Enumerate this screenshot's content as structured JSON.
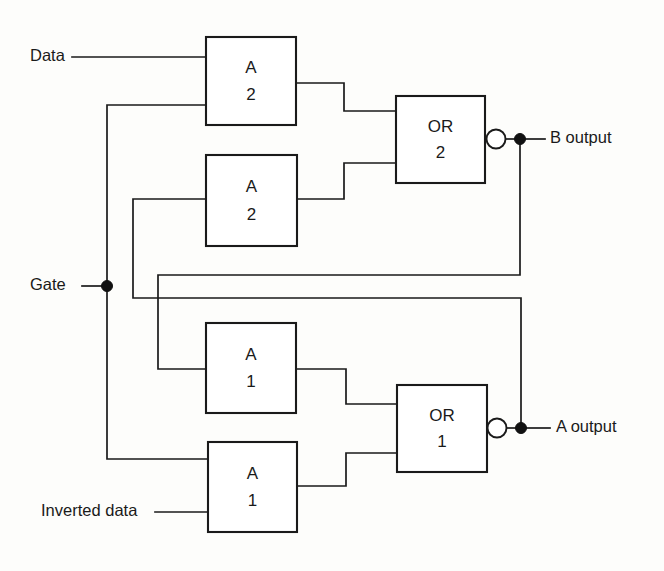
{
  "diagram": {
    "line_color": "#1a1a1a",
    "background_color": "#fdfdfb",
    "inputs": [
      {
        "id": "data",
        "label": "Data",
        "x": 30,
        "y": 57
      },
      {
        "id": "gate",
        "label": "Gate",
        "x": 30,
        "y": 286
      },
      {
        "id": "inverted_data",
        "label": "Inverted data",
        "x": 41,
        "y": 512
      }
    ],
    "outputs": [
      {
        "id": "b_output",
        "label": "B output",
        "x": 550,
        "y": 139
      },
      {
        "id": "a_output",
        "label": "A output",
        "x": 556,
        "y": 428
      }
    ],
    "gates": [
      {
        "id": "and-a2-top",
        "type": "AND",
        "line1": "A",
        "line2": "2",
        "x": 206,
        "y": 37,
        "w": 90,
        "h": 88
      },
      {
        "id": "and-a2-bottom",
        "type": "AND",
        "line1": "A",
        "line2": "2",
        "x": 206,
        "y": 155,
        "w": 91,
        "h": 91
      },
      {
        "id": "or-2",
        "type": "OR",
        "line1": "OR",
        "line2": "2",
        "x": 396,
        "y": 96,
        "w": 89,
        "h": 87
      },
      {
        "id": "and-a1-top",
        "type": "AND",
        "line1": "A",
        "line2": "1",
        "x": 206,
        "y": 323,
        "w": 90,
        "h": 90
      },
      {
        "id": "and-a1-bottom",
        "type": "AND",
        "line1": "A",
        "line2": "1",
        "x": 208,
        "y": 442,
        "w": 89,
        "h": 90
      },
      {
        "id": "or-1",
        "type": "OR",
        "line1": "OR",
        "line2": "1",
        "x": 397,
        "y": 385,
        "w": 90,
        "h": 87
      }
    ],
    "inverter_bubbles": [
      {
        "id": "bubble-or2",
        "cx": 496,
        "cy": 139,
        "r": 9.5
      },
      {
        "id": "bubble-or1",
        "cx": 497,
        "cy": 428,
        "r": 9.5
      }
    ],
    "junctions": [
      {
        "id": "junction-gate",
        "cx": 107,
        "cy": 286,
        "r": 5.5
      },
      {
        "id": "junction-b-output",
        "cx": 520,
        "cy": 139,
        "r": 5.5
      },
      {
        "id": "junction-a-output",
        "cx": 521,
        "cy": 428,
        "r": 5.5
      }
    ],
    "wires": [
      {
        "id": "wire-data-in",
        "d": "M 72 57 L 206 57"
      },
      {
        "id": "wire-gate-in",
        "d": "M 82 286 L 107 286"
      },
      {
        "id": "wire-inverteddata-in",
        "d": "M 155 512 L 208 512"
      },
      {
        "id": "wire-a2top-out",
        "d": "M 296 83 L 344 83 L 344 111 L 396 111"
      },
      {
        "id": "wire-a2bot-out",
        "d": "M 297 199 L 344 199 L 344 163 L 396 163"
      },
      {
        "id": "wire-a1top-out",
        "d": "M 296 369 L 346 369 L 346 404 L 397 404"
      },
      {
        "id": "wire-a1bot-out",
        "d": "M 297 486 L 346 486 L 346 453 L 397 453"
      },
      {
        "id": "wire-or2-to-bubble",
        "d": "M 485 139 L 487 139"
      },
      {
        "id": "wire-bubble-to-dot2",
        "d": "M 506 139 L 520 139"
      },
      {
        "id": "wire-dot2-to-label",
        "d": "M 520 139 L 545 139"
      },
      {
        "id": "wire-or1-to-bubble",
        "d": "M 487 428 L 488 428"
      },
      {
        "id": "wire-bubble-to-dot1",
        "d": "M 507 428 L 521 428"
      },
      {
        "id": "wire-dot1-to-label",
        "d": "M 521 428 L 550 428"
      },
      {
        "id": "wire-gate-up-to-a2top",
        "d": "M 107 286 L 107 105 L 206 105"
      },
      {
        "id": "wire-gate-down-to-a1bot",
        "d": "M 107 286 L 107 459 L 208 459"
      },
      {
        "id": "wire-bfeedback",
        "d": "M 520 139 L 520 275 L 158 275 L 158 369 L 206 369"
      },
      {
        "id": "wire-afeedback",
        "d": "M 521 428 L 521 298 L 133 298 L 133 199 L 206 199"
      }
    ]
  }
}
